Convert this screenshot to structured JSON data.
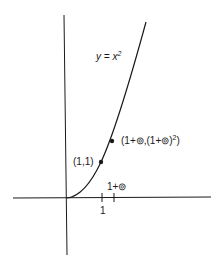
{
  "diagram": {
    "curve_label": "y = x",
    "curve_label_exp": "2",
    "point_a_label": "(1,1)",
    "point_b_label": "(1+⊚,(1+⊚)",
    "point_b_exp": "2",
    "point_b_close": ")",
    "tick_1_label": "1",
    "tick_2_label": "1+⊚",
    "color": "#1a1a1a"
  }
}
